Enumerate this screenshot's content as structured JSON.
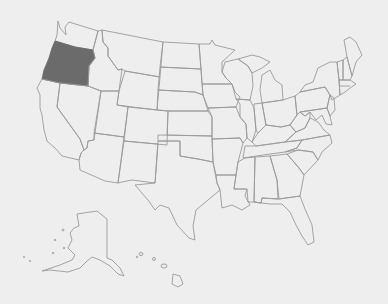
{
  "map": {
    "title": "United States",
    "highlighted_state": "Oregon",
    "highlight_color": "#6b6b6b",
    "border_color": "#9a9a9a",
    "background_color": "#eeeeee",
    "insets": [
      "Alaska",
      "Hawaii"
    ]
  }
}
